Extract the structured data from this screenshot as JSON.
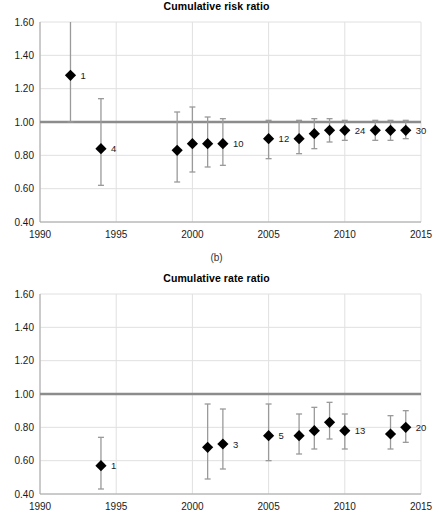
{
  "figure": {
    "caption": "(b)"
  },
  "chart_data": [
    {
      "id": "cumulative-risk-ratio",
      "type": "scatter",
      "title": "Cumulative risk ratio",
      "xlabel": "",
      "ylabel": "",
      "xlim": [
        1990,
        2015
      ],
      "ylim": [
        0.4,
        1.6
      ],
      "xticks": [
        1990,
        1995,
        2000,
        2005,
        2010,
        2015
      ],
      "xticklabels": [
        "1990",
        "1995",
        "2000",
        "2005",
        "2010",
        "2015"
      ],
      "yticks": [
        0.4,
        0.6,
        0.8,
        1.0,
        1.2,
        1.4,
        1.6
      ],
      "yticklabels": [
        "0.40",
        "0.60",
        "0.80",
        "1.00",
        "1.20",
        "1.40",
        "1.60"
      ],
      "grid": true,
      "reference_line": 1.0,
      "points": [
        {
          "x": 1992,
          "y": 1.28,
          "lo": 1.0,
          "hi": 1.72,
          "hi_clipped": true,
          "label": "1"
        },
        {
          "x": 1994,
          "y": 0.84,
          "lo": 0.62,
          "hi": 1.14,
          "hi_clipped": false,
          "label": "4"
        },
        {
          "x": 1999,
          "y": 0.83,
          "lo": 0.64,
          "hi": 1.06,
          "hi_clipped": false,
          "label": ""
        },
        {
          "x": 2000,
          "y": 0.87,
          "lo": 0.7,
          "hi": 1.09,
          "hi_clipped": false,
          "label": ""
        },
        {
          "x": 2001,
          "y": 0.87,
          "lo": 0.73,
          "hi": 1.03,
          "hi_clipped": false,
          "label": ""
        },
        {
          "x": 2002,
          "y": 0.87,
          "lo": 0.74,
          "hi": 1.02,
          "hi_clipped": false,
          "label": "10"
        },
        {
          "x": 2005,
          "y": 0.9,
          "lo": 0.78,
          "hi": 1.01,
          "hi_clipped": false,
          "label": "12"
        },
        {
          "x": 2007,
          "y": 0.9,
          "lo": 0.81,
          "hi": 1.01,
          "hi_clipped": false,
          "label": ""
        },
        {
          "x": 2008,
          "y": 0.93,
          "lo": 0.84,
          "hi": 1.02,
          "hi_clipped": false,
          "label": ""
        },
        {
          "x": 2009,
          "y": 0.95,
          "lo": 0.88,
          "hi": 1.02,
          "hi_clipped": false,
          "label": ""
        },
        {
          "x": 2010,
          "y": 0.95,
          "lo": 0.89,
          "hi": 1.01,
          "hi_clipped": false,
          "label": "24"
        },
        {
          "x": 2012,
          "y": 0.95,
          "lo": 0.89,
          "hi": 1.01,
          "hi_clipped": false,
          "label": ""
        },
        {
          "x": 2013,
          "y": 0.95,
          "lo": 0.89,
          "hi": 1.01,
          "hi_clipped": false,
          "label": ""
        },
        {
          "x": 2014,
          "y": 0.95,
          "lo": 0.9,
          "hi": 1.01,
          "hi_clipped": false,
          "label": "30"
        }
      ]
    },
    {
      "id": "cumulative-rate-ratio",
      "type": "scatter",
      "title": "Cumulative rate ratio",
      "xlabel": "",
      "ylabel": "",
      "xlim": [
        1990,
        2015
      ],
      "ylim": [
        0.4,
        1.6
      ],
      "xticks": [
        1990,
        1995,
        2000,
        2005,
        2010,
        2015
      ],
      "xticklabels": [
        "1990",
        "1995",
        "2000",
        "2005",
        "2010",
        "2015"
      ],
      "yticks": [
        0.4,
        0.6,
        0.8,
        1.0,
        1.2,
        1.4,
        1.6
      ],
      "yticklabels": [
        "0.40",
        "0.60",
        "0.80",
        "1.00",
        "1.20",
        "1.40",
        "1.60"
      ],
      "grid": true,
      "reference_line": 1.0,
      "points": [
        {
          "x": 1994,
          "y": 0.57,
          "lo": 0.43,
          "hi": 0.74,
          "hi_clipped": false,
          "label": "1"
        },
        {
          "x": 2001,
          "y": 0.68,
          "lo": 0.49,
          "hi": 0.94,
          "hi_clipped": false,
          "label": ""
        },
        {
          "x": 2002,
          "y": 0.7,
          "lo": 0.55,
          "hi": 0.91,
          "hi_clipped": false,
          "label": "3"
        },
        {
          "x": 2005,
          "y": 0.75,
          "lo": 0.6,
          "hi": 0.94,
          "hi_clipped": false,
          "label": "5"
        },
        {
          "x": 2007,
          "y": 0.75,
          "lo": 0.64,
          "hi": 0.88,
          "hi_clipped": false,
          "label": ""
        },
        {
          "x": 2008,
          "y": 0.78,
          "lo": 0.67,
          "hi": 0.92,
          "hi_clipped": false,
          "label": ""
        },
        {
          "x": 2009,
          "y": 0.83,
          "lo": 0.73,
          "hi": 0.95,
          "hi_clipped": false,
          "label": ""
        },
        {
          "x": 2010,
          "y": 0.78,
          "lo": 0.67,
          "hi": 0.88,
          "hi_clipped": false,
          "label": "13"
        },
        {
          "x": 2013,
          "y": 0.76,
          "lo": 0.67,
          "hi": 0.87,
          "hi_clipped": false,
          "label": ""
        },
        {
          "x": 2014,
          "y": 0.8,
          "lo": 0.71,
          "hi": 0.9,
          "hi_clipped": false,
          "label": "20"
        }
      ]
    }
  ],
  "colors": {
    "marker": "#000000",
    "ci": "#9a9a9a",
    "reference_line": "#8c8c8c",
    "grid": "#e0e0e0",
    "axis": "#a6a6a6",
    "text": "#1a1a1a"
  }
}
